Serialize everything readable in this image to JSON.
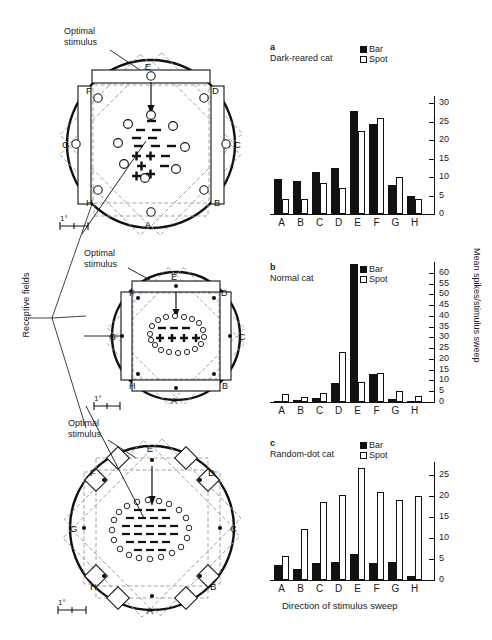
{
  "figure": {
    "receptive_fields_label": "Receptive fields",
    "optimal_stimulus_label": "Optimal\nstimulus",
    "scale_bar_label": "1°",
    "xaxis_title": "Direction of stimulus sweep",
    "yaxis_title": "Mean spikes/stimulus sweep",
    "directions": [
      "A",
      "B",
      "C",
      "D",
      "E",
      "F",
      "G",
      "H"
    ],
    "legend": [
      {
        "name": "bar",
        "label": "Bar",
        "fill": "#111111"
      },
      {
        "name": "spot",
        "label": "Spot",
        "fill": "#ffffff"
      }
    ]
  },
  "receptive_fields": [
    {
      "id": "rf-dark-reared",
      "optimal_stimulus": "Optimal\nstimulus",
      "scale": "1°",
      "direction_letters": [
        "A",
        "B",
        "C",
        "D",
        "E",
        "F",
        "G",
        "H"
      ],
      "center_symbols": "minus above, plus below",
      "surround_markers": "open circles"
    },
    {
      "id": "rf-normal",
      "optimal_stimulus": "Optimal\nstimulus",
      "scale": "1°",
      "direction_letters": [
        "A",
        "B",
        "C",
        "D",
        "E",
        "F",
        "G",
        "H"
      ],
      "center_symbols": "plus row flanked by minus dashes",
      "surround_markers": "small open circle ring"
    },
    {
      "id": "rf-random-dot",
      "optimal_stimulus": "Optimal\nstimulus",
      "scale": "1°",
      "direction_letters": [
        "A",
        "B",
        "C",
        "D",
        "E",
        "F",
        "G",
        "H"
      ],
      "center_symbols": "dense dash array",
      "surround_markers": "open circle ring"
    }
  ],
  "chart_data": [
    {
      "id": "chart-a",
      "type": "bar",
      "panel": "a",
      "title": "Dark-reared cat",
      "categories": [
        "A",
        "B",
        "C",
        "D",
        "E",
        "F",
        "G",
        "H"
      ],
      "series": [
        {
          "name": "Bar",
          "values": [
            9.5,
            9.0,
            11.5,
            12.5,
            28.0,
            24.5,
            8.0,
            5.0
          ]
        },
        {
          "name": "Spot",
          "values": [
            4.0,
            4.0,
            8.5,
            7.0,
            22.5,
            26.0,
            10.0,
            4.0
          ]
        }
      ],
      "xlabel": "",
      "ylabel": "Mean spikes/stimulus sweep",
      "ylim": [
        0,
        32
      ],
      "yticks": [
        0,
        5,
        10,
        15,
        20,
        25,
        30
      ],
      "grid": false,
      "legend_position": "top-right"
    },
    {
      "id": "chart-b",
      "type": "bar",
      "panel": "b",
      "title": "Normal cat",
      "categories": [
        "A",
        "B",
        "C",
        "D",
        "E",
        "F",
        "G",
        "H"
      ],
      "series": [
        {
          "name": "Bar",
          "values": [
            0.3,
            1.0,
            2.0,
            9.0,
            64.0,
            13.0,
            1.5,
            0.3
          ]
        },
        {
          "name": "Spot",
          "values": [
            3.5,
            2.5,
            4.0,
            23.0,
            9.5,
            13.5,
            5.0,
            3.0
          ]
        }
      ],
      "xlabel": "",
      "ylabel": "Mean spikes/stimulus sweep",
      "ylim": [
        0,
        65
      ],
      "yticks": [
        0,
        5,
        10,
        15,
        20,
        25,
        30,
        35,
        40,
        45,
        50,
        55,
        60
      ],
      "grid": false,
      "legend_position": "top-right"
    },
    {
      "id": "chart-c",
      "type": "bar",
      "panel": "c",
      "title": "Random-dot cat",
      "categories": [
        "A",
        "B",
        "C",
        "D",
        "E",
        "F",
        "G",
        "H"
      ],
      "series": [
        {
          "name": "Bar",
          "values": [
            3.5,
            2.5,
            4.0,
            4.2,
            6.2,
            4.0,
            4.2,
            1.0
          ]
        },
        {
          "name": "Spot",
          "values": [
            5.8,
            12.2,
            18.5,
            20.2,
            26.5,
            21.0,
            19.0,
            20.0
          ]
        }
      ],
      "xlabel": "Direction of stimulus sweep",
      "ylabel": "Mean spikes/stimulus sweep",
      "ylim": [
        0,
        28
      ],
      "yticks": [
        0,
        5,
        10,
        15,
        20,
        25
      ],
      "grid": false,
      "legend_position": "top-right"
    }
  ]
}
